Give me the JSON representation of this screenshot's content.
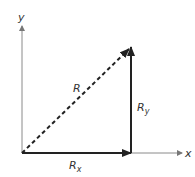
{
  "diagram": {
    "title": "",
    "type": "vector-components",
    "axes": {
      "x_label": "x",
      "y_label": "y"
    },
    "vectors": [
      {
        "name": "R",
        "label": "R",
        "sub": "",
        "style": "dashed",
        "from": [
          0,
          0
        ],
        "to": [
          1,
          1
        ]
      },
      {
        "name": "Rx",
        "label": "R",
        "sub": "x",
        "style": "solid",
        "from": [
          0,
          0
        ],
        "to": [
          1,
          0
        ]
      },
      {
        "name": "Ry",
        "label": "R",
        "sub": "y",
        "style": "solid",
        "from": [
          1,
          0
        ],
        "to": [
          1,
          1
        ]
      }
    ],
    "colors": {
      "axis": "#8a8a8a",
      "vector": "#222222",
      "text": "#333333",
      "background": "#ffffff"
    }
  }
}
